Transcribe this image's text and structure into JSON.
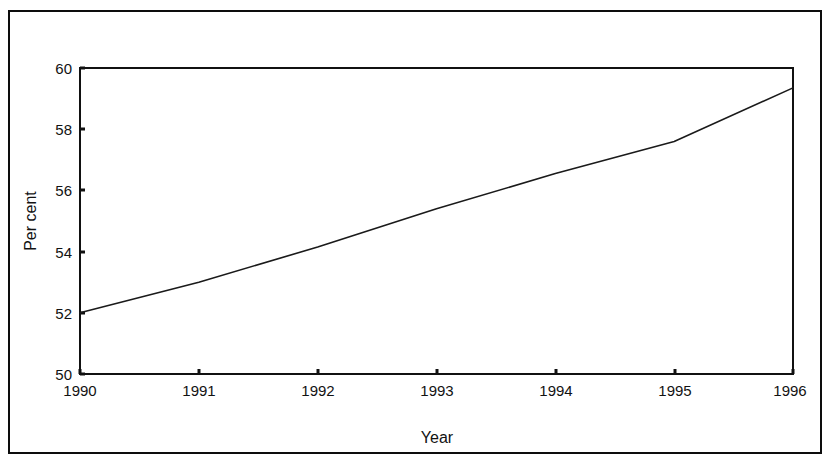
{
  "chart_data": {
    "type": "line",
    "title": "",
    "subtitle": "",
    "xlabel": "Year",
    "ylabel": "Per cent",
    "x": [
      1990,
      1991,
      1992,
      1993,
      1994,
      1995,
      1996
    ],
    "series": [
      {
        "name": "Per cent",
        "values": [
          52.0,
          53.0,
          54.15,
          55.4,
          56.55,
          57.6,
          59.35
        ],
        "color": "#1a1a1a",
        "style": "solid"
      }
    ],
    "xlim": [
      1990,
      1996
    ],
    "ylim": [
      50,
      60
    ],
    "xticks": [
      1990,
      1991,
      1992,
      1993,
      1994,
      1995,
      1996
    ],
    "yticks": [
      50,
      52,
      54,
      56,
      58,
      60
    ],
    "xtick_labels": [
      "1990",
      "1991",
      "1992",
      "1993",
      "1994",
      "1995",
      "1996"
    ],
    "ytick_labels": [
      "50",
      "52",
      "54",
      "56",
      "58",
      "60"
    ],
    "grid": false,
    "legend": null,
    "legend_position": "none",
    "annotations": []
  },
  "axes": {
    "y_axis_title": "Per cent",
    "x_axis_title": "Year"
  },
  "colors": {
    "frame": "#0d0d0d",
    "axis": "#111111",
    "line": "#1a1a1a",
    "background": "#ffffff",
    "text": "#121212"
  }
}
